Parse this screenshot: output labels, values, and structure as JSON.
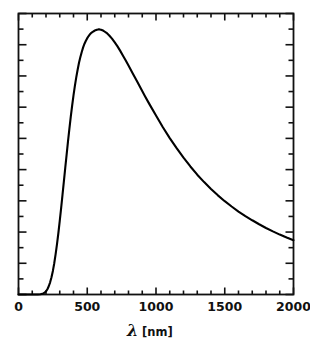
{
  "figure": {
    "background_color": "#ffffff",
    "foreground_color": "#000000",
    "width": 310,
    "height": 348
  },
  "axis": {
    "x_label_symbol": "λ",
    "x_label_unit": "[nm]",
    "x_label_full": "λ [nm]",
    "y_label": "",
    "frame_color": "#111111",
    "tick_color": "#111111"
  },
  "chart_data": {
    "type": "line",
    "title": "",
    "subtitle": "",
    "xlabel": "λ [nm]",
    "ylabel": "",
    "xlim": [
      0,
      2000
    ],
    "ylim": [
      0,
      1.06
    ],
    "grid": false,
    "legend": null,
    "legend_position": "none",
    "x_major_ticks": [
      0,
      500,
      1000,
      1500,
      2000
    ],
    "x_tick_labels": [
      "0",
      "500",
      "1000",
      "1500",
      "2000"
    ],
    "x_minor_tick_step": 100,
    "y_major_tick_count": 9,
    "y_minor_tick_count": 9,
    "y_tick_labels": [],
    "line_color": "#000000",
    "line_width": 2.1,
    "series": [
      {
        "name": "spectral radiance",
        "x": [
          0,
          50,
          100,
          120,
          140,
          160,
          180,
          190,
          200,
          210,
          220,
          230,
          240,
          250,
          260,
          270,
          280,
          290,
          300,
          310,
          320,
          330,
          340,
          350,
          360,
          370,
          380,
          390,
          400,
          410,
          420,
          430,
          440,
          450,
          460,
          470,
          480,
          490,
          500,
          510,
          520,
          530,
          540,
          550,
          560,
          570,
          580,
          590,
          600,
          610,
          620,
          640,
          660,
          680,
          700,
          720,
          740,
          760,
          780,
          800,
          830,
          860,
          890,
          920,
          950,
          1000,
          1050,
          1100,
          1150,
          1200,
          1250,
          1300,
          1350,
          1400,
          1450,
          1500,
          1550,
          1600,
          1650,
          1700,
          1750,
          1800,
          1850,
          1900,
          1950,
          2000
        ],
        "y": [
          0.0,
          0.0,
          0.0,
          0.0,
          0.0,
          0.001,
          0.004,
          0.007,
          0.012,
          0.02,
          0.031,
          0.046,
          0.065,
          0.089,
          0.118,
          0.152,
          0.19,
          0.232,
          0.278,
          0.326,
          0.376,
          0.427,
          0.478,
          0.528,
          0.578,
          0.625,
          0.67,
          0.712,
          0.751,
          0.787,
          0.819,
          0.848,
          0.874,
          0.896,
          0.915,
          0.932,
          0.946,
          0.957,
          0.967,
          0.975,
          0.982,
          0.987,
          0.991,
          0.994,
          0.997,
          0.999,
          1.0,
          1.0,
          0.999,
          0.997,
          0.994,
          0.987,
          0.977,
          0.965,
          0.951,
          0.936,
          0.919,
          0.901,
          0.883,
          0.864,
          0.835,
          0.806,
          0.777,
          0.748,
          0.72,
          0.675,
          0.631,
          0.59,
          0.552,
          0.516,
          0.483,
          0.452,
          0.424,
          0.398,
          0.374,
          0.352,
          0.332,
          0.313,
          0.296,
          0.28,
          0.265,
          0.251,
          0.238,
          0.226,
          0.215,
          0.205
        ]
      }
    ]
  }
}
